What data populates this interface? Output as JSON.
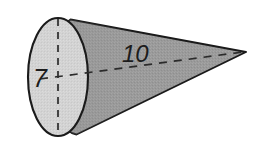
{
  "figure": {
    "name": "cone-diagram",
    "shape": "cone",
    "background_color": "#ffffff",
    "outline_color": "#1a1a1a",
    "body_fill": "#9a9a9a",
    "base_fill": "#d2d2d2",
    "dash_color": "#2b2b2b",
    "labels": {
      "radius": "7",
      "slant": "10"
    },
    "geometry": {
      "base_center_x": 58,
      "base_center_y": 77,
      "base_rx": 30,
      "base_ry": 59,
      "apex_x": 246,
      "apex_y": 52
    }
  }
}
